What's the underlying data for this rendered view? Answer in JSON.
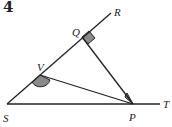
{
  "problem_number": "4",
  "diagram": {
    "points": {
      "S": "S",
      "V": "V",
      "Q": "Q",
      "R": "R",
      "P": "P",
      "T": "T"
    },
    "segments": [
      "S-R",
      "S-T",
      "Q-P",
      "V-P"
    ],
    "marked_angles": [
      {
        "vertex": "Q",
        "type": "right-angle",
        "between": [
          "R",
          "P"
        ]
      },
      {
        "vertex": "V",
        "type": "arc",
        "between": [
          "S",
          "P"
        ]
      },
      {
        "vertex": "P",
        "type": "arc",
        "between": [
          "Q",
          "V"
        ]
      }
    ],
    "colors": {
      "line": "#222222",
      "shade": "#8a8a8a"
    }
  }
}
